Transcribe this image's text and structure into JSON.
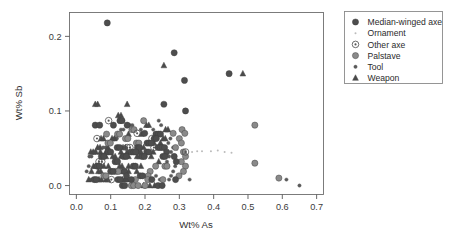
{
  "chart_data": {
    "type": "scatter",
    "title": "",
    "xlabel": "Wt% As",
    "ylabel": "Wt% Sb",
    "xlim": [
      -0.02,
      0.72
    ],
    "ylim": [
      -0.012,
      0.232
    ],
    "xticks": [
      "0.0",
      "0.1",
      "0.2",
      "0.3",
      "0.4",
      "0.5",
      "0.6",
      "0.7"
    ],
    "xtick_values": [
      0.0,
      0.1,
      0.2,
      0.3,
      0.4,
      0.5,
      0.6,
      0.7
    ],
    "yticks": [
      "0.0",
      "0.1",
      "0.2"
    ],
    "ytick_values": [
      0.0,
      0.1,
      0.2
    ],
    "grid": false,
    "legend_position": "right-outside",
    "series": [
      {
        "name": "Median-winged axe",
        "marker": "filled-circle",
        "color": "#4d4d4d",
        "size": 3.1,
        "points": [
          [
            0.09,
            0.218
          ],
          [
            0.285,
            0.178
          ],
          [
            0.315,
            0.141
          ],
          [
            0.255,
            0.109
          ],
          [
            0.318,
            0.1
          ],
          [
            0.445,
            0.15
          ],
          [
            0.055,
            0.081
          ],
          [
            0.068,
            0.081
          ],
          [
            0.127,
            0.087
          ],
          [
            0.133,
            0.087
          ],
          [
            0.108,
            0.081
          ],
          [
            0.148,
            0.081
          ],
          [
            0.199,
            0.07
          ],
          [
            0.232,
            0.069
          ],
          [
            0.239,
            0.069
          ],
          [
            0.245,
            0.069
          ],
          [
            0.227,
            0.063
          ],
          [
            0.233,
            0.063
          ],
          [
            0.206,
            0.057
          ],
          [
            0.212,
            0.057
          ],
          [
            0.218,
            0.057
          ],
          [
            0.238,
            0.051
          ],
          [
            0.244,
            0.051
          ],
          [
            0.25,
            0.051
          ],
          [
            0.257,
            0.051
          ],
          [
            0.263,
            0.045
          ],
          [
            0.178,
            0.051
          ],
          [
            0.184,
            0.051
          ],
          [
            0.119,
            0.051
          ],
          [
            0.126,
            0.051
          ],
          [
            0.093,
            0.045
          ],
          [
            0.1,
            0.045
          ],
          [
            0.16,
            0.045
          ],
          [
            0.167,
            0.045
          ],
          [
            0.173,
            0.045
          ],
          [
            0.205,
            0.045
          ],
          [
            0.211,
            0.045
          ],
          [
            0.252,
            0.039
          ],
          [
            0.258,
            0.039
          ],
          [
            0.073,
            0.039
          ],
          [
            0.08,
            0.039
          ],
          [
            0.138,
            0.039
          ],
          [
            0.145,
            0.039
          ],
          [
            0.192,
            0.039
          ],
          [
            0.198,
            0.039
          ],
          [
            0.285,
            0.039
          ],
          [
            0.291,
            0.032
          ],
          [
            0.113,
            0.032
          ],
          [
            0.12,
            0.032
          ],
          [
            0.166,
            0.026
          ],
          [
            0.172,
            0.026
          ],
          [
            0.061,
            0.026
          ],
          [
            0.067,
            0.026
          ],
          [
            0.1,
            0.019
          ],
          [
            0.107,
            0.019
          ],
          [
            0.14,
            0.019
          ],
          [
            0.146,
            0.013
          ],
          [
            0.186,
            0.013
          ],
          [
            0.193,
            0.013
          ],
          [
            0.052,
            0.008
          ],
          [
            0.058,
            0.008
          ],
          [
            0.121,
            0.008
          ],
          [
            0.128,
            0.008
          ],
          [
            0.16,
            0.008
          ],
          [
            0.22,
            0.008
          ],
          [
            0.289,
            0.008
          ],
          [
            0.134,
            0.0
          ],
          [
            0.141,
            0.0
          ],
          [
            0.238,
            0.0
          ],
          [
            0.25,
            0.0
          ]
        ]
      },
      {
        "name": "Ornament",
        "marker": "tiny-dot",
        "color": "#bbbbbb",
        "size": 1.0,
        "points": [
          [
            0.392,
            0.046
          ],
          [
            0.412,
            0.047
          ],
          [
            0.432,
            0.045
          ],
          [
            0.452,
            0.044
          ],
          [
            0.337,
            0.045
          ],
          [
            0.352,
            0.046
          ],
          [
            0.366,
            0.046
          ],
          [
            0.306,
            0.047
          ],
          [
            0.294,
            0.048
          ]
        ]
      },
      {
        "name": "Other axe",
        "marker": "circle-dot",
        "color": "#555555",
        "size": 3.3,
        "points": [
          [
            0.094,
            0.087
          ],
          [
            0.177,
            0.07
          ],
          [
            0.06,
            0.063
          ],
          [
            0.22,
            0.063
          ],
          [
            0.148,
            0.051
          ],
          [
            0.156,
            0.051
          ],
          [
            0.226,
            0.051
          ],
          [
            0.318,
            0.045
          ],
          [
            0.066,
            0.032
          ],
          [
            0.074,
            0.032
          ],
          [
            0.102,
            0.008
          ]
        ]
      },
      {
        "name": "Palstave",
        "marker": "filled-circle-light",
        "color": "#8a8a8a",
        "size": 3.1,
        "points": [
          [
            0.52,
            0.081
          ],
          [
            0.52,
            0.03
          ],
          [
            0.59,
            0.01
          ],
          [
            0.196,
            0.087
          ],
          [
            0.308,
            0.075
          ],
          [
            0.316,
            0.07
          ],
          [
            0.282,
            0.07
          ],
          [
            0.162,
            0.075
          ],
          [
            0.168,
            0.075
          ],
          [
            0.3,
            0.063
          ],
          [
            0.306,
            0.057
          ],
          [
            0.289,
            0.051
          ],
          [
            0.312,
            0.045
          ],
          [
            0.318,
            0.039
          ],
          [
            0.306,
            0.032
          ],
          [
            0.318,
            0.026
          ],
          [
            0.312,
            0.019
          ],
          [
            0.299,
            0.013
          ],
          [
            0.215,
            0.019
          ],
          [
            0.209,
            0.013
          ],
          [
            0.12,
            0.069
          ],
          [
            0.126,
            0.069
          ],
          [
            0.088,
            0.069
          ],
          [
            0.175,
            0.057
          ],
          [
            0.182,
            0.057
          ],
          [
            0.143,
            0.063
          ],
          [
            0.15,
            0.063
          ],
          [
            0.092,
            0.057
          ],
          [
            0.099,
            0.057
          ],
          [
            0.258,
            0.026
          ],
          [
            0.264,
            0.026
          ],
          [
            0.231,
            0.026
          ],
          [
            0.115,
            0.019
          ],
          [
            0.122,
            0.019
          ],
          [
            0.08,
            0.013
          ],
          [
            0.086,
            0.013
          ],
          [
            0.172,
            0.008
          ],
          [
            0.208,
            0.008
          ],
          [
            0.252,
            0.008
          ],
          [
            0.16,
            0.0
          ],
          [
            0.167,
            0.0
          ],
          [
            0.18,
            0.0
          ],
          [
            0.2,
            0.0
          ]
        ]
      },
      {
        "name": "Tool",
        "marker": "small-dot",
        "color": "#5a5a5a",
        "size": 1.7,
        "points": [
          [
            0.24,
            0.087
          ],
          [
            0.247,
            0.081
          ],
          [
            0.13,
            0.075
          ],
          [
            0.137,
            0.075
          ],
          [
            0.156,
            0.081
          ],
          [
            0.163,
            0.081
          ],
          [
            0.188,
            0.075
          ],
          [
            0.224,
            0.075
          ],
          [
            0.274,
            0.063
          ],
          [
            0.268,
            0.057
          ],
          [
            0.282,
            0.051
          ],
          [
            0.276,
            0.045
          ],
          [
            0.27,
            0.039
          ],
          [
            0.264,
            0.032
          ],
          [
            0.288,
            0.026
          ],
          [
            0.282,
            0.019
          ],
          [
            0.276,
            0.013
          ],
          [
            0.27,
            0.008
          ],
          [
            0.243,
            0.008
          ],
          [
            0.232,
            0.013
          ],
          [
            0.118,
            0.063
          ],
          [
            0.111,
            0.063
          ],
          [
            0.085,
            0.051
          ],
          [
            0.078,
            0.051
          ],
          [
            0.056,
            0.045
          ],
          [
            0.05,
            0.045
          ],
          [
            0.044,
            0.039
          ],
          [
            0.038,
            0.039
          ],
          [
            0.036,
            0.026
          ],
          [
            0.03,
            0.019
          ],
          [
            0.04,
            0.008
          ],
          [
            0.046,
            0.008
          ],
          [
            0.65,
            0.0
          ],
          [
            0.612,
            0.008
          ],
          [
            0.33,
            0.008
          ]
        ]
      },
      {
        "name": "Weapon",
        "marker": "triangle",
        "color": "#4a4a4a",
        "size": 2.6,
        "points": [
          [
            0.255,
            0.161
          ],
          [
            0.485,
            0.15
          ],
          [
            0.055,
            0.109
          ],
          [
            0.062,
            0.109
          ],
          [
            0.122,
            0.094
          ],
          [
            0.13,
            0.094
          ],
          [
            0.148,
            0.109
          ],
          [
            0.204,
            0.081
          ],
          [
            0.211,
            0.081
          ],
          [
            0.26,
            0.075
          ],
          [
            0.267,
            0.075
          ],
          [
            0.152,
            0.069
          ],
          [
            0.189,
            0.069
          ],
          [
            0.253,
            0.063
          ],
          [
            0.259,
            0.063
          ],
          [
            0.219,
            0.057
          ],
          [
            0.226,
            0.057
          ],
          [
            0.245,
            0.057
          ],
          [
            0.072,
            0.063
          ],
          [
            0.079,
            0.063
          ],
          [
            0.104,
            0.063
          ],
          [
            0.111,
            0.063
          ],
          [
            0.062,
            0.051
          ],
          [
            0.069,
            0.051
          ],
          [
            0.092,
            0.051
          ],
          [
            0.136,
            0.051
          ],
          [
            0.143,
            0.051
          ],
          [
            0.196,
            0.051
          ],
          [
            0.042,
            0.045
          ],
          [
            0.049,
            0.045
          ],
          [
            0.056,
            0.045
          ],
          [
            0.07,
            0.045
          ],
          [
            0.086,
            0.045
          ],
          [
            0.13,
            0.045
          ],
          [
            0.148,
            0.045
          ],
          [
            0.181,
            0.045
          ],
          [
            0.188,
            0.045
          ],
          [
            0.224,
            0.045
          ],
          [
            0.086,
            0.039
          ],
          [
            0.106,
            0.039
          ],
          [
            0.113,
            0.039
          ],
          [
            0.13,
            0.039
          ],
          [
            0.152,
            0.039
          ],
          [
            0.177,
            0.039
          ],
          [
            0.184,
            0.039
          ],
          [
            0.218,
            0.039
          ],
          [
            0.24,
            0.032
          ],
          [
            0.05,
            0.026
          ],
          [
            0.056,
            0.026
          ],
          [
            0.08,
            0.026
          ],
          [
            0.093,
            0.026
          ],
          [
            0.126,
            0.026
          ],
          [
            0.133,
            0.026
          ],
          [
            0.152,
            0.026
          ],
          [
            0.188,
            0.026
          ],
          [
            0.044,
            0.019
          ],
          [
            0.064,
            0.019
          ],
          [
            0.071,
            0.019
          ],
          [
            0.126,
            0.019
          ],
          [
            0.133,
            0.019
          ],
          [
            0.152,
            0.019
          ],
          [
            0.176,
            0.019
          ],
          [
            0.036,
            0.008
          ],
          [
            0.066,
            0.008
          ],
          [
            0.073,
            0.008
          ],
          [
            0.086,
            0.008
          ],
          [
            0.092,
            0.008
          ],
          [
            0.134,
            0.008
          ],
          [
            0.141,
            0.008
          ],
          [
            0.148,
            0.008
          ],
          [
            0.196,
            0.0
          ],
          [
            0.214,
            0.0
          ],
          [
            0.228,
            0.0
          ]
        ]
      }
    ]
  },
  "legend": {
    "entries": [
      {
        "label": "Median-winged axe",
        "marker": "filled-circle"
      },
      {
        "label": "Ornament",
        "marker": "tiny-dot"
      },
      {
        "label": "Other axe",
        "marker": "circle-dot"
      },
      {
        "label": "Palstave",
        "marker": "filled-circle-light"
      },
      {
        "label": "Tool",
        "marker": "small-dot"
      },
      {
        "label": "Weapon",
        "marker": "triangle"
      }
    ]
  }
}
